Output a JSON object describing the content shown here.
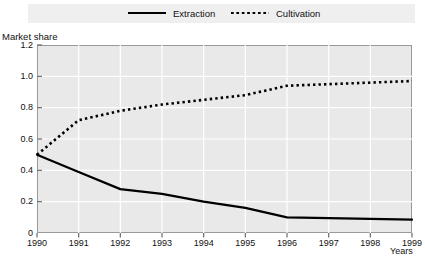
{
  "chart_data": {
    "type": "line",
    "title": "",
    "xlabel": "Years",
    "ylabel": "Market share",
    "x": [
      1990,
      1991,
      1992,
      1993,
      1994,
      1995,
      1996,
      1997,
      1998,
      1999
    ],
    "xtick_labels": [
      "1990",
      "1991",
      "1992",
      "1993",
      "1994",
      "1995",
      "1996",
      "1997",
      "1998",
      "1999"
    ],
    "ytick_labels": [
      "0",
      "0.2",
      "0.4",
      "0.6",
      "0.8",
      "1.0",
      "1.2"
    ],
    "ytick_values": [
      0,
      0.2,
      0.4,
      0.6,
      0.8,
      1.0,
      1.2
    ],
    "ylim": [
      0,
      1.2
    ],
    "xlim": [
      1990,
      1999
    ],
    "grid": true,
    "grid_color": "#ffffff",
    "plot_bg": "#e9e9e9",
    "legend_position": "top",
    "legend_bg": "#efefef",
    "series": [
      {
        "name": "Extraction",
        "style": "solid",
        "color": "#000000",
        "values": [
          0.5,
          0.39,
          0.28,
          0.25,
          0.2,
          0.16,
          0.1,
          0.095,
          0.09,
          0.085
        ]
      },
      {
        "name": "Cultivation",
        "style": "dotted",
        "color": "#000000",
        "values": [
          0.5,
          0.72,
          0.78,
          0.82,
          0.85,
          0.88,
          0.94,
          0.95,
          0.96,
          0.97
        ]
      }
    ]
  }
}
